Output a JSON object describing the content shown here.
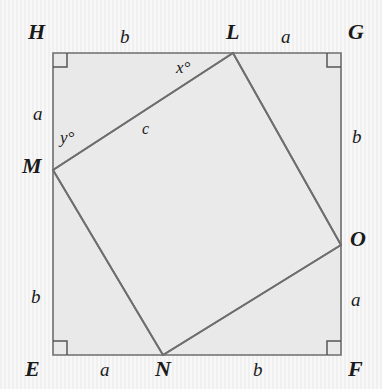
{
  "figure": {
    "outer_square": {
      "name": "EFGH",
      "fill_color": "#e9e9e9",
      "stroke_color": "#6e6e6e",
      "corner_marks": "right-angle squares at E, F, G, H"
    },
    "inner_quad": {
      "name": "LMNO",
      "fill_color": "#e9e9e9",
      "stroke_color": "#6e6e6e"
    }
  },
  "vertices": [
    {
      "id": "H",
      "label": "H",
      "x": 53,
      "y": 53,
      "label_x": 28,
      "label_y": 21
    },
    {
      "id": "G",
      "label": "G",
      "x": 341,
      "y": 53,
      "label_x": 348,
      "label_y": 21
    },
    {
      "id": "E",
      "label": "E",
      "x": 53,
      "y": 355,
      "label_x": 25,
      "label_y": 358
    },
    {
      "id": "F",
      "label": "F",
      "x": 341,
      "y": 355,
      "label_x": 348,
      "label_y": 358
    },
    {
      "id": "L",
      "label": "L",
      "x": 233,
      "y": 53,
      "label_x": 226,
      "label_y": 21
    },
    {
      "id": "M",
      "label": "M",
      "x": 53,
      "y": 170,
      "label_x": 22,
      "label_y": 155
    },
    {
      "id": "N",
      "label": "N",
      "x": 163,
      "y": 355,
      "label_x": 155,
      "label_y": 358
    },
    {
      "id": "O",
      "label": "O",
      "x": 341,
      "y": 245,
      "label_x": 350,
      "label_y": 228
    }
  ],
  "side_labels": [
    {
      "id": "top-HL",
      "text": "b",
      "x": 120,
      "y": 27
    },
    {
      "id": "top-LG",
      "text": "a",
      "x": 281,
      "y": 27
    },
    {
      "id": "left-HM",
      "text": "a",
      "x": 33,
      "y": 104
    },
    {
      "id": "left-ME",
      "text": "b",
      "x": 31,
      "y": 287
    },
    {
      "id": "right-GO",
      "text": "b",
      "x": 352,
      "y": 127
    },
    {
      "id": "right-OF",
      "text": "a",
      "x": 351,
      "y": 290
    },
    {
      "id": "bottom-EN",
      "text": "a",
      "x": 100,
      "y": 360
    },
    {
      "id": "bottom-NF",
      "text": "b",
      "x": 253,
      "y": 360
    }
  ],
  "angle_labels": [
    {
      "id": "angle-x",
      "text": "x°",
      "x": 176,
      "y": 59
    },
    {
      "id": "angle-y",
      "text": "y°",
      "x": 60,
      "y": 129
    }
  ],
  "segment_labels": [
    {
      "id": "segment-c",
      "text": "c",
      "x": 142,
      "y": 121
    }
  ]
}
